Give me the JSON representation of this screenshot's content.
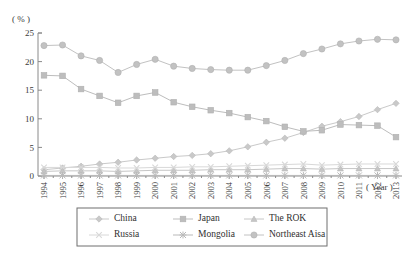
{
  "chart_data": {
    "type": "line",
    "title": "",
    "xlabel": "( Year )",
    "ylabel": "( % )",
    "ylim": [
      0,
      25
    ],
    "yticks": [
      0,
      5,
      10,
      15,
      20,
      25
    ],
    "grid": false,
    "legend_position": "bottom",
    "categories": [
      "1994",
      "1995",
      "1996",
      "1997",
      "1998",
      "1999",
      "2000",
      "2001",
      "2002",
      "2003",
      "2004",
      "2005",
      "2006",
      "2007",
      "2008",
      "2009",
      "2010",
      "2011",
      "2012",
      "2013"
    ],
    "series": [
      {
        "name": "China",
        "marker": "diamond",
        "color": "#c9c9c9",
        "values": [
          1.1,
          1.4,
          1.7,
          2.1,
          2.4,
          2.8,
          3.1,
          3.4,
          3.6,
          3.9,
          4.4,
          5.1,
          5.9,
          6.6,
          7.6,
          8.7,
          9.5,
          10.4,
          11.6,
          12.7
        ]
      },
      {
        "name": "Japan",
        "marker": "square",
        "color": "#bdbdbd",
        "values": [
          17.6,
          17.5,
          15.2,
          14.0,
          12.8,
          14.0,
          14.6,
          12.9,
          12.1,
          11.5,
          11.0,
          10.3,
          9.6,
          8.6,
          7.8,
          8.0,
          9.0,
          8.9,
          8.8,
          6.8
        ]
      },
      {
        "name": "The ROK",
        "marker": "triangle",
        "color": "#c6c6c6",
        "values": [
          0.8,
          0.9,
          0.9,
          0.9,
          0.8,
          0.9,
          1.0,
          1.0,
          1.0,
          1.1,
          1.1,
          1.1,
          1.2,
          1.3,
          1.3,
          1.2,
          1.3,
          1.3,
          1.3,
          1.3
        ]
      },
      {
        "name": "Russia",
        "marker": "x-thin",
        "color": "#d8d8d8",
        "values": [
          1.5,
          1.5,
          1.5,
          1.5,
          1.4,
          1.4,
          1.5,
          1.5,
          1.6,
          1.6,
          1.7,
          1.8,
          1.9,
          2.0,
          2.1,
          1.9,
          2.0,
          2.1,
          2.1,
          2.1
        ]
      },
      {
        "name": "Mongolia",
        "marker": "asterisk",
        "color": "#b9b9b9",
        "values": [
          0.1,
          0.1,
          0.1,
          0.1,
          0.1,
          0.1,
          0.1,
          0.1,
          0.1,
          0.1,
          0.1,
          0.1,
          0.1,
          0.1,
          0.1,
          0.1,
          0.1,
          0.1,
          0.1,
          0.1
        ]
      },
      {
        "name": "Northeast Aisa",
        "marker": "circle",
        "color": "#c2c2c2",
        "values": [
          22.8,
          22.9,
          21.0,
          20.2,
          18.1,
          19.5,
          20.4,
          19.2,
          18.8,
          18.6,
          18.5,
          18.5,
          19.3,
          20.2,
          21.4,
          22.2,
          23.1,
          23.6,
          23.9,
          23.8
        ]
      }
    ]
  },
  "legend": {
    "entries": [
      {
        "label": "China"
      },
      {
        "label": "Japan"
      },
      {
        "label": "The ROK"
      },
      {
        "label": "Russia"
      },
      {
        "label": "Mongolia"
      },
      {
        "label": "Northeast Aisa"
      }
    ]
  }
}
